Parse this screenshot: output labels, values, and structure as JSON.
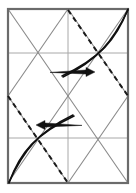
{
  "figure": {
    "type": "line-diagram",
    "background_color": "#ffffff",
    "canvas": {
      "width": 136,
      "height": 193
    },
    "frame": {
      "label": "outer-rectangle",
      "x": 8,
      "y": 9,
      "width": 120,
      "height": 174,
      "stroke_color": "#6b6b6b",
      "stroke_width": 2.2
    },
    "grid": {
      "label": "quarter-grid",
      "stroke_color": "#a8a8a8",
      "stroke_width": 1,
      "vertical_lines": [
        {
          "x": 68,
          "y1": 9,
          "y2": 183
        }
      ],
      "horizontal_lines": [
        {
          "y": 53,
          "x1": 8,
          "x2": 128
        },
        {
          "y": 138,
          "x1": 8,
          "x2": 128
        }
      ]
    },
    "diagonals": {
      "label": "quadrant-x-creases",
      "stroke_color": "#8a8a8a",
      "stroke_width": 1.1,
      "segments": [
        {
          "x1": 8,
          "y1": 9,
          "x2": 68,
          "y2": 96
        },
        {
          "x1": 68,
          "y1": 9,
          "x2": 8,
          "y2": 96
        },
        {
          "x1": 68,
          "y1": 9,
          "x2": 128,
          "y2": 96
        },
        {
          "x1": 128,
          "y1": 9,
          "x2": 68,
          "y2": 96
        },
        {
          "x1": 8,
          "y1": 96,
          "x2": 68,
          "y2": 183
        },
        {
          "x1": 68,
          "y1": 96,
          "x2": 8,
          "y2": 183
        },
        {
          "x1": 68,
          "y1": 96,
          "x2": 128,
          "y2": 183
        },
        {
          "x1": 128,
          "y1": 96,
          "x2": 68,
          "y2": 183
        }
      ]
    },
    "dashed_folds": {
      "label": "valley-fold-lines",
      "stroke_color": "#1a1a1a",
      "stroke_width": 2.0,
      "dash_pattern": "5,4",
      "segments": [
        {
          "name": "upper-right-dashed",
          "x1": 68,
          "y1": 10,
          "x2": 128,
          "y2": 96
        },
        {
          "name": "lower-left-dashed",
          "x1": 8,
          "y1": 96,
          "x2": 68,
          "y2": 183
        }
      ]
    },
    "curves": {
      "label": "folded-flap-curves",
      "stroke_color": "#111111",
      "stroke_width": 1.6,
      "paths": [
        {
          "name": "upper-outer-curve",
          "d": "M 128 9 C 116 40, 100 58, 62 76"
        },
        {
          "name": "upper-inner-curve",
          "d": "M 128 10 C 112 42, 98 60, 63 77"
        },
        {
          "name": "lower-outer-curve",
          "d": "M 9 183 C 20 152, 36 134, 74 116"
        },
        {
          "name": "lower-inner-curve",
          "d": "M 9 182 C 24 150, 38 132, 73 115"
        }
      ]
    },
    "arrows": [
      {
        "name": "fold-arrow-right",
        "direction": "right",
        "tail_x": 50,
        "tail_y": 72,
        "head_x": 95,
        "head_y": 72,
        "color": "#111111"
      },
      {
        "name": "fold-arrow-left",
        "direction": "left",
        "tail_x": 82,
        "tail_y": 125,
        "head_x": 36,
        "head_y": 125,
        "color": "#111111"
      }
    ]
  }
}
